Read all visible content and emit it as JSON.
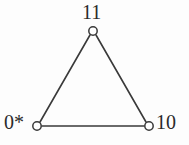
{
  "figure": {
    "kind": "undirected-graph-triangle",
    "background_color": "#fdfdfd",
    "stroke_color": "#3a3a3a",
    "label_color": "#2b2b2b",
    "node_fill_color": "#ffffff",
    "nodes": [
      {
        "id": "apex",
        "label": "11",
        "cx": 93,
        "cy": 31,
        "r": 4.2
      },
      {
        "id": "bottom-left",
        "label": "0*",
        "cx": 37,
        "cy": 126,
        "r": 4.2
      },
      {
        "id": "bottom-right",
        "label": "10",
        "cx": 149,
        "cy": 126,
        "r": 4.2
      }
    ],
    "edges": [
      {
        "from": "apex",
        "to": "bottom-left",
        "x1": 90,
        "y1": 35,
        "x2": 40,
        "y2": 122
      },
      {
        "from": "apex",
        "to": "bottom-right",
        "x1": 96,
        "y1": 35,
        "x2": 146,
        "y2": 122
      },
      {
        "from": "bottom-left",
        "to": "bottom-right",
        "x1": 42,
        "y1": 126,
        "x2": 144,
        "y2": 126
      }
    ],
    "labels": {
      "apex": "11",
      "bottom_left": "0*",
      "bottom_right": "10"
    }
  }
}
